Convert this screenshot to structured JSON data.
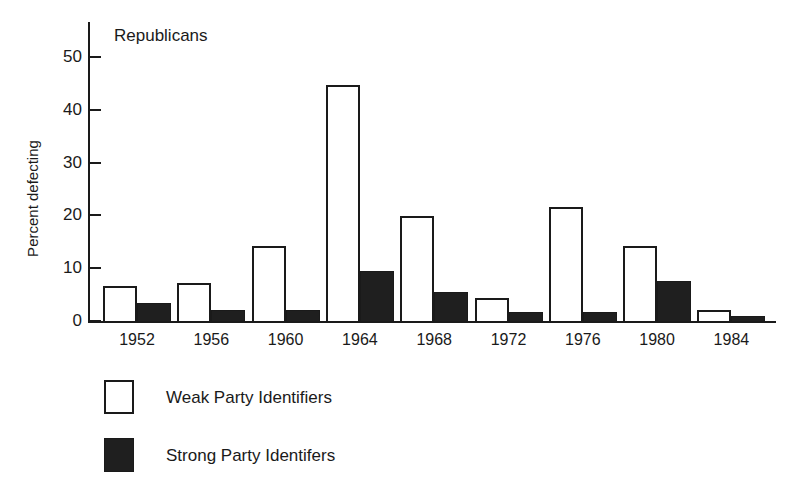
{
  "chart_data": {
    "type": "bar",
    "title": "Republicans",
    "xlabel": "",
    "ylabel": "Percent defecting",
    "categories": [
      "1952",
      "1956",
      "1960",
      "1964",
      "1968",
      "1972",
      "1976",
      "1980",
      "1984"
    ],
    "ylim": [
      0,
      55
    ],
    "yticks": [
      0,
      10,
      20,
      30,
      40,
      50
    ],
    "ytick_labels": [
      "0",
      "10",
      "20",
      "30",
      "40",
      "50"
    ],
    "grid": false,
    "legend_position": "below-plot-left",
    "series": [
      {
        "name": "Weak Party Identifiers",
        "fill": "white",
        "values": [
          6.7,
          7.2,
          14.2,
          44.7,
          19.8,
          4.4,
          21.6,
          14.2,
          2.0
        ]
      },
      {
        "name": "Strong Party Identifers",
        "fill": "black",
        "values": [
          3.4,
          2.0,
          2.0,
          9.5,
          5.4,
          1.7,
          1.7,
          7.6,
          1.0
        ]
      }
    ]
  },
  "colors": {
    "ink": "#1a1a1a",
    "weak_fill": "#ffffff",
    "strong_fill": "#1f1f1f",
    "background": "#ffffff"
  },
  "legend": {
    "items": [
      {
        "label": "Weak Party Identifiers",
        "swatch": "weak"
      },
      {
        "label": "Strong Party Identifers",
        "swatch": "strong"
      }
    ]
  }
}
